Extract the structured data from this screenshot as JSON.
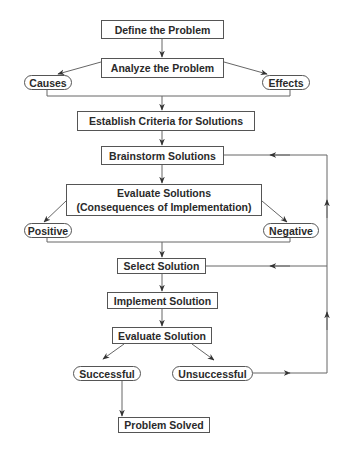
{
  "diagram": {
    "type": "flowchart",
    "colors": {
      "stroke": "#555555",
      "text": "#2a2a2a",
      "background": "#ffffff"
    },
    "nodes": {
      "define": {
        "label": "Define the Problem",
        "shape": "box"
      },
      "analyze": {
        "label": "Analyze the Problem",
        "shape": "box"
      },
      "causes": {
        "label": "Causes",
        "shape": "pill"
      },
      "effects": {
        "label": "Effects",
        "shape": "pill"
      },
      "criteria": {
        "label": "Establish Criteria for Solutions",
        "shape": "box"
      },
      "brainstorm": {
        "label": "Brainstorm Solutions",
        "shape": "box"
      },
      "evaluate_solutions": {
        "line1": "Evaluate Solutions",
        "line2": "(Consequences of Implementation)",
        "shape": "box"
      },
      "positive": {
        "label": "Positive",
        "shape": "pill"
      },
      "negative": {
        "label": "Negative",
        "shape": "pill"
      },
      "select": {
        "label": "Select Solution",
        "shape": "box"
      },
      "implement": {
        "label": "Implement Solution",
        "shape": "box"
      },
      "evaluate_solution": {
        "label": "Evaluate Solution",
        "shape": "box"
      },
      "successful": {
        "label": "Successful",
        "shape": "pill"
      },
      "unsuccessful": {
        "label": "Unsuccessful",
        "shape": "pill"
      },
      "solved": {
        "label": "Problem Solved",
        "shape": "box"
      }
    },
    "edges": [
      [
        "define",
        "analyze"
      ],
      [
        "analyze",
        "causes"
      ],
      [
        "analyze",
        "effects"
      ],
      [
        "causes+effects",
        "criteria"
      ],
      [
        "criteria",
        "brainstorm"
      ],
      [
        "brainstorm",
        "evaluate_solutions"
      ],
      [
        "evaluate_solutions",
        "positive"
      ],
      [
        "evaluate_solutions",
        "negative"
      ],
      [
        "positive+negative",
        "select"
      ],
      [
        "select",
        "implement"
      ],
      [
        "implement",
        "evaluate_solution"
      ],
      [
        "evaluate_solution",
        "successful"
      ],
      [
        "evaluate_solution",
        "unsuccessful"
      ],
      [
        "successful",
        "solved"
      ],
      [
        "unsuccessful",
        "select (feedback loop)"
      ],
      [
        "unsuccessful",
        "brainstorm (feedback loop)"
      ]
    ]
  }
}
